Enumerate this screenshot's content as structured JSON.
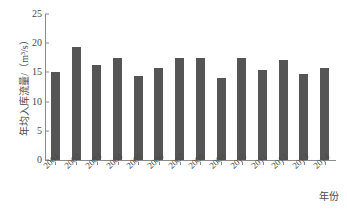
{
  "chart_data": {
    "type": "bar",
    "title": "",
    "xlabel": "年份",
    "ylabel": "年均入库流量/（m³/s）",
    "categories": [
      "2001",
      "2002",
      "2003",
      "2004",
      "2005",
      "2006",
      "2007",
      "2008",
      "2009",
      "2010",
      "2011",
      "2012",
      "2013",
      "2014"
    ],
    "values": [
      15.1,
      19.3,
      16.3,
      17.5,
      14.4,
      15.7,
      17.4,
      17.4,
      14.0,
      17.5,
      15.4,
      17.1,
      14.8,
      15.8
    ],
    "ylim": [
      0,
      25
    ],
    "ytick_labels": [
      "0",
      "5",
      "10",
      "15",
      "20",
      "25"
    ],
    "ytick_values": [
      0,
      5,
      10,
      15,
      20,
      25
    ],
    "grid": false,
    "legend": null,
    "bar_color": "#555555",
    "axis_color": "#8a8a8a",
    "background": "#ffffff"
  }
}
